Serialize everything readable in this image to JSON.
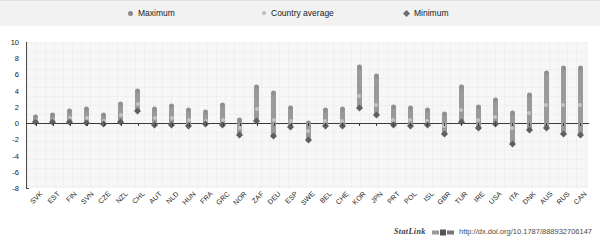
{
  "legend": {
    "items": [
      {
        "label": "Maximum",
        "marker": "filled-circle-dark",
        "color": "#8a8a8a"
      },
      {
        "label": "Country average",
        "marker": "filled-circle-light",
        "color": "#bdbdbd"
      },
      {
        "label": "Minimum",
        "marker": "filled-diamond",
        "color": "#6f6f6f"
      }
    ]
  },
  "footer": {
    "statlink_label": "StatLink",
    "url": "http://dx.doi.org/10.1787/888932706147"
  },
  "chart_data": {
    "type": "bar",
    "subtype": "range-bar-with-markers",
    "title": "",
    "xlabel": "",
    "ylabel": "",
    "ylim": [
      -8,
      10
    ],
    "ytick_values": [
      10,
      8,
      6,
      4,
      2,
      0,
      -2,
      -4,
      -6,
      -8
    ],
    "ytick_labels": [
      "10",
      "8",
      "6",
      "4",
      "2",
      "0",
      "-2",
      "-4",
      "-6",
      "-8"
    ],
    "grid": true,
    "zero_line": 0,
    "legend_position": "top",
    "categories": [
      "SVK",
      "EST",
      "FIN",
      "SVN",
      "CZE",
      "NZL",
      "CHL",
      "AUT",
      "NLD",
      "HUN",
      "FRA",
      "GRC",
      "NOR",
      "ZAF",
      "DEU",
      "ESP",
      "SWE",
      "BEL",
      "CHE",
      "KOR",
      "JPN",
      "PRT",
      "POL",
      "ISL",
      "GBR",
      "TUR",
      "IRE",
      "USA",
      "ITA",
      "DNK",
      "AUS",
      "RUS",
      "CAN"
    ],
    "series": [
      {
        "name": "Maximum",
        "values": [
          0.8,
          1.0,
          1.5,
          1.8,
          1.0,
          2.3,
          3.9,
          1.7,
          2.1,
          1.6,
          1.4,
          2.2,
          0.4,
          4.5,
          3.7,
          1.9,
          0.0,
          1.6,
          1.7,
          6.9,
          5.8,
          2.0,
          1.9,
          1.6,
          1.1,
          4.4,
          2.0,
          2.8,
          1.2,
          3.5,
          6.2,
          6.8,
          6.8
        ]
      },
      {
        "name": "Country average",
        "values": [
          0.4,
          0.4,
          0.6,
          0.6,
          0.2,
          1.0,
          2.4,
          0.6,
          0.6,
          0.4,
          0.2,
          0.4,
          -0.6,
          1.8,
          0.4,
          0.2,
          -1.0,
          0.2,
          0.2,
          3.4,
          2.2,
          0.4,
          0.4,
          0.2,
          -0.4,
          1.6,
          0.4,
          0.8,
          -0.6,
          1.2,
          2.2,
          2.2,
          2.2
        ]
      },
      {
        "name": "Minimum",
        "values": [
          0.1,
          0.1,
          0.1,
          0.0,
          -0.1,
          0.1,
          1.5,
          -0.2,
          -0.2,
          -0.4,
          -0.1,
          -0.2,
          -1.5,
          0.2,
          -1.6,
          -0.5,
          -2.1,
          -0.4,
          -0.4,
          1.9,
          1.0,
          -0.2,
          -0.3,
          -0.2,
          -1.4,
          0.1,
          -0.6,
          -0.1,
          -2.6,
          -0.8,
          -0.6,
          -1.4,
          -1.5
        ]
      }
    ]
  }
}
